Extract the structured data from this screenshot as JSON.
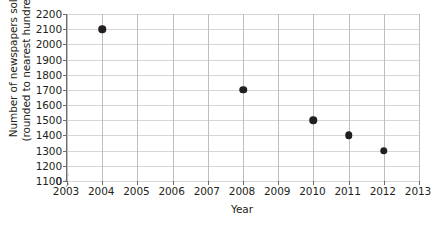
{
  "chart_data": {
    "type": "scatter",
    "title": "",
    "xlabel": "Year",
    "ylabel": "Number of newspapers sold (rounded to nearest hundred)",
    "ylabel_lines": [
      "Number of newspapers sold",
      "(rounded to nearest hundred)"
    ],
    "x": [
      2004,
      2008,
      2010,
      2011,
      2012
    ],
    "values": [
      2100,
      1700,
      1500,
      1400,
      1300
    ],
    "points": [
      {
        "year": 2004,
        "value": 2100
      },
      {
        "year": 2008,
        "value": 1700
      },
      {
        "year": 2010,
        "value": 1500
      },
      {
        "year": 2011,
        "value": 1400
      },
      {
        "year": 2012,
        "value": 1300
      }
    ],
    "xlim": [
      2003,
      2013
    ],
    "ylim": [
      1100,
      2200
    ],
    "xticks": [
      2003,
      2004,
      2005,
      2006,
      2007,
      2008,
      2009,
      2010,
      2011,
      2012,
      2013
    ],
    "xtick_labels": [
      "2003",
      "2004",
      "2005",
      "2006",
      "2007",
      "2008",
      "2009",
      "2010",
      "2011",
      "2012",
      "2013"
    ],
    "yticks": [
      1100,
      1200,
      1300,
      1400,
      1500,
      1600,
      1700,
      1800,
      1900,
      2000,
      2100,
      2200
    ],
    "ytick_labels": [
      "2200",
      "2100",
      "2000",
      "1900",
      "1800",
      "1700",
      "1600",
      "1500",
      "1400",
      "1300",
      "1200",
      "1100",
      "0"
    ],
    "y_axis_break": true,
    "y_axis_break_label": "0",
    "grid": "both",
    "legend": "none",
    "marker_color": "#231f20",
    "gridline_color": "#d6d7d9",
    "axis_color": "#6d6e71",
    "text_color": "#231f20",
    "background": "#ffffff"
  }
}
